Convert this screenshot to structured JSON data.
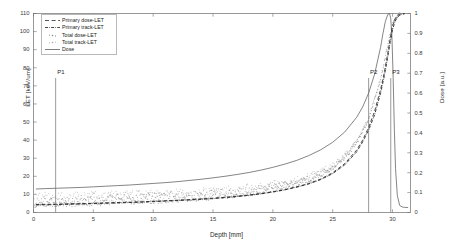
{
  "chart_data": {
    "type": "line",
    "title": "",
    "xlabel": "Depth [mm]",
    "ylabel": "LET [keV/um]",
    "ylabel_right": "Dose [a.u.]",
    "xlim": [
      0,
      31.5
    ],
    "ylim": [
      0,
      110
    ],
    "ylim_right": [
      0,
      1
    ],
    "grid": false,
    "legend_position": "upper left",
    "xticks": [
      "0",
      "5",
      "10",
      "15",
      "20",
      "25",
      "30"
    ],
    "xtick_values": [
      0,
      5,
      10,
      15,
      20,
      25,
      30
    ],
    "yticks_left": [
      "0",
      "10",
      "20",
      "30",
      "40",
      "50",
      "60",
      "70",
      "80",
      "90",
      "100",
      "110"
    ],
    "ytick_left_values": [
      0,
      10,
      20,
      30,
      40,
      50,
      60,
      70,
      80,
      90,
      100,
      110
    ],
    "yticks_right": [
      "0",
      "0.1",
      "0.2",
      "0.3",
      "0.4",
      "0.5",
      "0.6",
      "0.7",
      "0.8",
      "0.9",
      "1"
    ],
    "ytick_right_values": [
      0,
      0.1,
      0.2,
      0.3,
      0.4,
      0.5,
      0.6,
      0.7,
      0.8,
      0.9,
      1
    ],
    "annotations": [
      {
        "label": "P1",
        "x": 1.85,
        "axis": "x",
        "line_top_y": 78
      },
      {
        "label": "P2",
        "x": 28.0,
        "axis": "x",
        "line_top_y": 78
      },
      {
        "label": "P3",
        "x": 29.85,
        "axis": "x",
        "line_top_y": 78
      }
    ],
    "series": [
      {
        "name": "Primary dose-LET",
        "style": "dashed",
        "color": "#2a2a2a",
        "axis": "left",
        "x": [
          0.2,
          1,
          2,
          3,
          4,
          5,
          6,
          7,
          8,
          9,
          10,
          11,
          12,
          13,
          14,
          15,
          16,
          17,
          18,
          19,
          20,
          21,
          22,
          23,
          24,
          25,
          26,
          27,
          27.5,
          28,
          28.5,
          29,
          29.3,
          29.6,
          29.8,
          30,
          30.2,
          30.4,
          30.6,
          30.8,
          31
        ],
        "y": [
          4.4,
          4.5,
          4.6,
          4.8,
          4.9,
          5.1,
          5.3,
          5.5,
          5.7,
          5.9,
          6.2,
          6.5,
          6.8,
          7.1,
          7.5,
          7.9,
          8.4,
          9.0,
          9.7,
          10.5,
          11.5,
          12.7,
          14.2,
          16.0,
          18.5,
          22.0,
          27.0,
          34.5,
          40.0,
          47.0,
          56.0,
          68.0,
          77.0,
          88.0,
          96.0,
          103.0,
          107.0,
          109.0,
          109.5,
          109.8,
          110.0
        ]
      },
      {
        "name": "Primary track-LET",
        "style": "dash-dot",
        "color": "#1a1a1a",
        "axis": "left",
        "x": [
          0.2,
          1,
          2,
          3,
          4,
          5,
          6,
          7,
          8,
          9,
          10,
          11,
          12,
          13,
          14,
          15,
          16,
          17,
          18,
          19,
          20,
          21,
          22,
          23,
          24,
          25,
          26,
          27,
          27.5,
          28,
          28.5,
          29,
          29.3,
          29.6,
          29.8,
          30,
          30.2,
          30.4,
          30.6,
          30.8,
          31
        ],
        "y": [
          4.2,
          4.3,
          4.4,
          4.6,
          4.7,
          4.9,
          5.1,
          5.3,
          5.5,
          5.7,
          6.0,
          6.3,
          6.6,
          6.9,
          7.3,
          7.7,
          8.2,
          8.8,
          9.5,
          10.3,
          11.3,
          12.5,
          14.0,
          15.8,
          18.2,
          21.5,
          26.3,
          33.5,
          39.0,
          45.5,
          54.0,
          66.0,
          75.0,
          86.0,
          94.0,
          101.0,
          105.5,
          108.0,
          109.0,
          109.5,
          109.8
        ]
      },
      {
        "name": "Total dose-LET",
        "style": "scatter",
        "color": "#7d7d7d",
        "axis": "left",
        "x": [
          0.2,
          1,
          2,
          3,
          4,
          5,
          6,
          7,
          8,
          9,
          10,
          11,
          12,
          13,
          14,
          15,
          16,
          17,
          18,
          19,
          20,
          21,
          22,
          23,
          24,
          25,
          26,
          27,
          28,
          29,
          29.5,
          30,
          30.5
        ],
        "y": [
          5.0,
          5.1,
          5.2,
          5.4,
          5.5,
          5.7,
          5.9,
          6.1,
          6.4,
          6.6,
          6.9,
          7.2,
          7.6,
          8.0,
          8.4,
          8.9,
          9.5,
          10.2,
          11.0,
          11.9,
          13.0,
          14.3,
          16.0,
          18.0,
          20.7,
          24.5,
          30.0,
          38.0,
          51.0,
          73.0,
          89.0,
          104.0,
          109.0
        ]
      },
      {
        "name": "Total track-LET",
        "style": "scatter",
        "color": "#a5a5a5",
        "axis": "left",
        "x": [
          0.2,
          1,
          2,
          3,
          4,
          5,
          6,
          7,
          8,
          9,
          10,
          11,
          12,
          13,
          14,
          15,
          16,
          17,
          18,
          19,
          20,
          21,
          22,
          23,
          24,
          25,
          26,
          27,
          28,
          29,
          29.5,
          30,
          30.5
        ],
        "y": [
          6.2,
          6.2,
          6.3,
          6.4,
          6.5,
          6.6,
          6.8,
          7.0,
          7.2,
          7.4,
          7.7,
          8.0,
          8.3,
          8.7,
          9.1,
          9.6,
          10.2,
          10.9,
          11.7,
          12.6,
          13.7,
          15.0,
          16.6,
          18.6,
          21.2,
          25.0,
          30.5,
          38.5,
          51.5,
          73.5,
          89.5,
          104.5,
          109.5
        ]
      },
      {
        "name": "Dose",
        "style": "solid",
        "color": "#5c5c5c",
        "axis": "right",
        "x": [
          0.2,
          1,
          2,
          3,
          4,
          5,
          6,
          7,
          8,
          9,
          10,
          11,
          12,
          13,
          14,
          15,
          16,
          17,
          18,
          19,
          20,
          21,
          22,
          23,
          24,
          25,
          26,
          27,
          27.5,
          28,
          28.5,
          29,
          29.2,
          29.4,
          29.6,
          29.75,
          29.85,
          29.95,
          30.05,
          30.15,
          30.25,
          30.4,
          30.6,
          30.8,
          31,
          31.3
        ],
        "y": [
          0.118,
          0.12,
          0.122,
          0.124,
          0.126,
          0.129,
          0.132,
          0.135,
          0.138,
          0.142,
          0.146,
          0.15,
          0.155,
          0.161,
          0.167,
          0.174,
          0.182,
          0.191,
          0.201,
          0.213,
          0.227,
          0.243,
          0.262,
          0.286,
          0.315,
          0.353,
          0.404,
          0.478,
          0.53,
          0.6,
          0.695,
          0.83,
          0.9,
          0.96,
          0.995,
          1.0,
          0.975,
          0.88,
          0.68,
          0.42,
          0.22,
          0.085,
          0.035,
          0.028,
          0.026,
          0.025
        ]
      }
    ]
  },
  "legend": {
    "items": [
      {
        "label": "Primary dose-LET",
        "symbol": "dashed-line"
      },
      {
        "label": "Primary track-LET",
        "symbol": "dash-dot-line"
      },
      {
        "label": "Total dose-LET",
        "symbol": "scatter-dots"
      },
      {
        "label": "Total track-LET",
        "symbol": "scatter-dots"
      },
      {
        "label": "Dose",
        "symbol": "solid-line"
      }
    ]
  },
  "colors": {
    "axis": "#4a4a4a",
    "primary_dose": "#2a2a2a",
    "primary_track": "#1a1a1a",
    "total_dose": "#7d7d7d",
    "total_track": "#a5a5a5",
    "dose": "#5c5c5c",
    "marker_line": "#6f6f6f"
  }
}
